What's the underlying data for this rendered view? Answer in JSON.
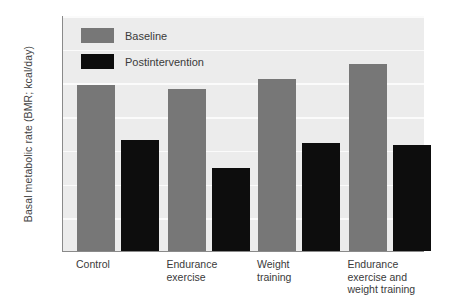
{
  "chart_data": {
    "type": "bar",
    "title": "",
    "xlabel": "",
    "ylabel": "Basal metabolic rate (BMR; kcal/day)",
    "ylim": [
      1200,
      1900
    ],
    "yticks": [
      1200,
      1300,
      1400,
      1500,
      1600,
      1700,
      1800,
      1900
    ],
    "grid": true,
    "legend_position": "top-left",
    "categories": [
      "Control",
      "Endurance\nexercise",
      "Weight\ntraining",
      "Endurance\nexercise and\nweight training"
    ],
    "series": [
      {
        "name": "Baseline",
        "color": "#777777",
        "values": [
          1692,
          1681,
          1711,
          1754
        ]
      },
      {
        "name": "Postintervention",
        "color": "#0d0d0d",
        "values": [
          1528,
          1446,
          1520,
          1515
        ]
      }
    ]
  },
  "colors": {
    "plot_background": "#ececec",
    "gridline": "#fbfbfb",
    "axis": "#8a8a8a",
    "text": "#3a3a3a"
  }
}
